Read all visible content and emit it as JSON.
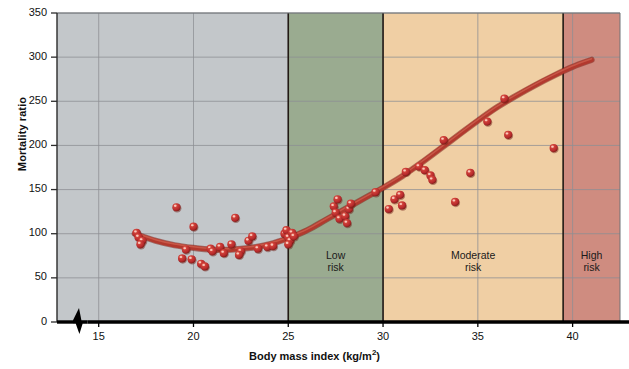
{
  "chart_data": {
    "type": "scatter",
    "title": "",
    "xlabel": "Body mass index (kg/m²)",
    "xlabel_base": "Body mass index (kg/m",
    "xlabel_sup": "2",
    "xlabel_tail": ")",
    "ylabel": "Mortality ratio",
    "xlim": [
      12.8,
      42.5
    ],
    "ylim": [
      0,
      350
    ],
    "xticks": [
      15,
      20,
      25,
      30,
      35,
      40
    ],
    "yticks": [
      0,
      50,
      100,
      150,
      200,
      250,
      300,
      350
    ],
    "grid": true,
    "axis_break": true,
    "legend": "none",
    "series": [
      {
        "name": "Mortality ratio observations",
        "type": "scatter",
        "marker_color": "#b5292c",
        "points": [
          [
            17.0,
            101
          ],
          [
            17.1,
            96
          ],
          [
            17.3,
            92
          ],
          [
            17.2,
            88
          ],
          [
            19.1,
            130
          ],
          [
            19.6,
            82
          ],
          [
            19.4,
            72
          ],
          [
            19.9,
            71
          ],
          [
            20.0,
            108
          ],
          [
            20.4,
            66
          ],
          [
            20.6,
            63
          ],
          [
            20.9,
            83
          ],
          [
            21.0,
            80
          ],
          [
            21.4,
            85
          ],
          [
            21.6,
            78
          ],
          [
            22.0,
            88
          ],
          [
            22.2,
            118
          ],
          [
            22.5,
            80
          ],
          [
            22.4,
            76
          ],
          [
            22.9,
            92
          ],
          [
            23.1,
            97
          ],
          [
            23.4,
            83
          ],
          [
            23.9,
            85
          ],
          [
            24.2,
            86
          ],
          [
            24.8,
            100
          ],
          [
            24.9,
            104
          ],
          [
            25.0,
            96
          ],
          [
            25.1,
            92
          ],
          [
            25.0,
            88
          ],
          [
            25.2,
            101
          ],
          [
            25.3,
            97
          ],
          [
            27.4,
            131
          ],
          [
            27.5,
            124
          ],
          [
            27.6,
            139
          ],
          [
            27.7,
            117
          ],
          [
            28.0,
            120
          ],
          [
            28.1,
            112
          ],
          [
            28.2,
            128
          ],
          [
            28.3,
            134
          ],
          [
            29.6,
            147
          ],
          [
            30.3,
            128
          ],
          [
            30.6,
            139
          ],
          [
            30.9,
            144
          ],
          [
            31.0,
            132
          ],
          [
            31.2,
            170
          ],
          [
            31.9,
            176
          ],
          [
            32.2,
            172
          ],
          [
            32.5,
            166
          ],
          [
            32.6,
            161
          ],
          [
            33.2,
            206
          ],
          [
            33.8,
            136
          ],
          [
            34.6,
            169
          ],
          [
            35.5,
            227
          ],
          [
            36.4,
            253
          ],
          [
            36.6,
            212
          ],
          [
            39.0,
            197
          ]
        ]
      },
      {
        "name": "Fitted mortality curve",
        "type": "line",
        "line_color": "#b2392e",
        "points": [
          [
            16.9,
            100
          ],
          [
            18.0,
            92
          ],
          [
            19.0,
            87
          ],
          [
            20.0,
            84
          ],
          [
            21.0,
            82
          ],
          [
            22.0,
            82
          ],
          [
            23.0,
            84
          ],
          [
            24.0,
            88
          ],
          [
            25.0,
            95
          ],
          [
            26.0,
            104
          ],
          [
            27.0,
            116
          ],
          [
            28.0,
            128
          ],
          [
            29.0,
            140
          ],
          [
            30.0,
            152
          ],
          [
            31.0,
            165
          ],
          [
            32.0,
            180
          ],
          [
            33.0,
            196
          ],
          [
            34.0,
            212
          ],
          [
            35.0,
            228
          ],
          [
            36.0,
            243
          ],
          [
            37.0,
            256
          ],
          [
            38.0,
            268
          ],
          [
            39.0,
            279
          ],
          [
            40.0,
            289
          ],
          [
            41.0,
            297
          ]
        ]
      }
    ],
    "zones": [
      {
        "name": "underweight-normal-zone",
        "label": "",
        "x_start": 12.8,
        "x_end": 25.0,
        "color": "#c3c7ca"
      },
      {
        "name": "low-risk-zone",
        "label_line1": "Low",
        "label_line2": "risk",
        "x_start": 25.0,
        "x_end": 30.0,
        "color": "#9aab90"
      },
      {
        "name": "moderate-risk-zone",
        "label_line1": "Moderate",
        "label_line2": "risk",
        "x_start": 30.0,
        "x_end": 39.5,
        "color": "#f0cfa4"
      },
      {
        "name": "high-risk-zone",
        "label_line1": "High",
        "label_line2": "risk",
        "x_start": 39.5,
        "x_end": 42.5,
        "color": "#cf8c80"
      }
    ],
    "colors": {
      "grid": "#8d9094",
      "axis": "#000000",
      "marker": "#b5292c",
      "marker_highlight": "#e86a5c",
      "curve": "#b2392e",
      "gray_zone": "#c3c7ca",
      "green_zone": "#9aab90",
      "orange_zone": "#f0cfa4",
      "red_zone": "#cf8c80"
    }
  }
}
